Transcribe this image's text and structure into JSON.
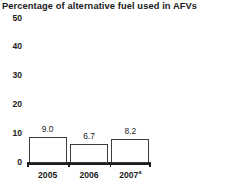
{
  "chart_data": {
    "type": "bar",
    "title": "Percentage of alternative fuel used in AFVs",
    "xlabel": "",
    "ylabel": "",
    "categories": [
      "2005",
      "2006",
      "2007"
    ],
    "category_labels": [
      "2005",
      "2006",
      "2007"
    ],
    "category_superscripts": [
      "",
      "",
      "a"
    ],
    "values": [
      9.0,
      6.7,
      8.2
    ],
    "value_labels": [
      "9.0",
      "6.7",
      "8.2"
    ],
    "ylim": [
      0,
      50
    ],
    "yticks": [
      0,
      10,
      20,
      30,
      40,
      50
    ],
    "ytick_labels": [
      "0",
      "10",
      "20",
      "30",
      "40",
      "50"
    ],
    "grid": false,
    "legend": null,
    "bar_fill_color": "#ffffff",
    "bar_edge_color": "#3c3c3c",
    "axis_color": "#1c1c1c",
    "background_color": "#ffffff",
    "text_color": "#1a1a1a"
  }
}
